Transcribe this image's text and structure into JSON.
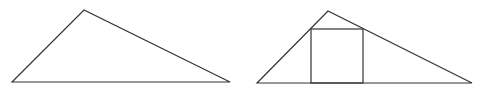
{
  "diagram": {
    "stroke_color": "#333333",
    "background": "#ffffff",
    "figures": [
      {
        "name": "triangle-left",
        "points": [
          [
            12,
            82
          ],
          [
            84,
            10
          ],
          [
            230,
            82
          ]
        ]
      },
      {
        "name": "triangle-right",
        "points": [
          [
            257,
            83
          ],
          [
            328,
            11
          ],
          [
            472,
            83
          ]
        ],
        "inscribed_square": {
          "x": 311,
          "y": 29,
          "width": 52,
          "height": 54
        }
      }
    ]
  }
}
